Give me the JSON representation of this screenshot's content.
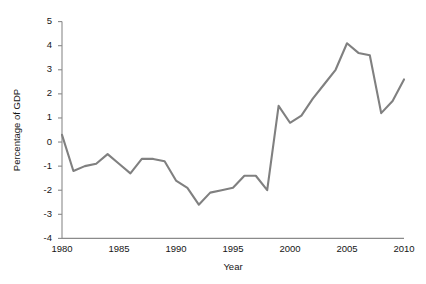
{
  "chart_data": {
    "type": "line",
    "title": "",
    "xlabel": "Year",
    "ylabel": "Percentage of GDP",
    "xlim": [
      1980,
      2010
    ],
    "ylim": [
      -4,
      5
    ],
    "grid": false,
    "legend": false,
    "line_color": "#808080",
    "x": [
      1980,
      1981,
      1982,
      1983,
      1984,
      1985,
      1986,
      1987,
      1988,
      1989,
      1990,
      1991,
      1992,
      1993,
      1994,
      1995,
      1996,
      1997,
      1998,
      1999,
      2000,
      2001,
      2002,
      2003,
      2004,
      2005,
      2006,
      2007,
      2008,
      2009,
      2010
    ],
    "values": [
      0.3,
      -1.2,
      -1.0,
      -0.9,
      -0.5,
      -0.9,
      -1.3,
      -0.7,
      -0.7,
      -0.8,
      -1.6,
      -1.9,
      -2.6,
      -2.1,
      -2.0,
      -1.9,
      -1.4,
      -1.4,
      -2.0,
      1.5,
      0.8,
      1.1,
      1.8,
      2.4,
      3.0,
      4.1,
      3.7,
      3.6,
      1.2,
      1.7,
      2.6
    ],
    "x_ticks": [
      1980,
      1985,
      1990,
      1995,
      2000,
      2005,
      2010
    ],
    "x_tick_labels": [
      "1980",
      "1985",
      "1990",
      "1995",
      "2000",
      "2005",
      "2010"
    ],
    "y_ticks": [
      5,
      4,
      3,
      2,
      1,
      0,
      -1,
      -2,
      -3,
      -4
    ],
    "y_tick_labels": [
      "5",
      "4",
      "3",
      "2",
      "1",
      "0",
      "-1",
      "-2",
      "-3",
      "-4"
    ]
  }
}
